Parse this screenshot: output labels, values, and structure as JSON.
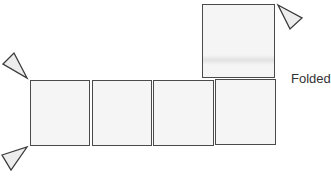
{
  "diagram": {
    "label": "Folded",
    "panels": [
      {
        "id": "panel-1",
        "row": "bottom",
        "position": 1
      },
      {
        "id": "panel-2",
        "row": "bottom",
        "position": 2
      },
      {
        "id": "panel-3",
        "row": "bottom",
        "position": 3
      },
      {
        "id": "panel-4",
        "row": "bottom",
        "position": 4
      },
      {
        "id": "panel-folded",
        "row": "top",
        "position": 4,
        "state": "folded-up"
      }
    ],
    "markers": [
      {
        "id": "triangle-top-left",
        "icon": "triangle-pointer-icon"
      },
      {
        "id": "triangle-bottom-left",
        "icon": "triangle-pointer-icon"
      },
      {
        "id": "triangle-top-right",
        "icon": "triangle-pointer-icon"
      }
    ],
    "colors": {
      "stroke": "#4a4a4a",
      "fill": "#f5f5f5",
      "text": "#333333"
    }
  }
}
